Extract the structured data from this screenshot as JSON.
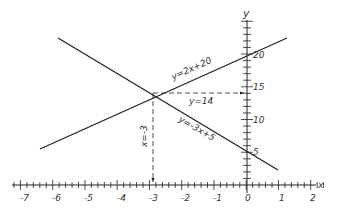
{
  "diagram": {
    "title": "",
    "axes": {
      "x_label": "x",
      "y_label": "y",
      "x_ticks": [
        "-7",
        "-6",
        "-5",
        "-4",
        "-3",
        "-2",
        "-1",
        "0",
        "1",
        "2"
      ],
      "y_ticks": [
        "5",
        "10",
        "15",
        "20"
      ]
    },
    "lines": [
      {
        "equation": "y=2x+20"
      },
      {
        "equation": "y=-3x+5"
      }
    ],
    "annotations": {
      "intersection_y": "y=14",
      "intersection_x": "x=-3"
    },
    "colors": {
      "ink": "#222222",
      "background": "#ffffff"
    }
  },
  "chart_data": {
    "type": "line",
    "title": "",
    "xlabel": "x",
    "ylabel": "y",
    "xlim": [
      -7,
      2
    ],
    "ylim": [
      0,
      22
    ],
    "grid": false,
    "series": [
      {
        "name": "y=2x+20",
        "x": [
          -7.2,
          1.2
        ],
        "y": [
          5.6,
          22.4
        ]
      },
      {
        "name": "y=-3x+5",
        "x": [
          -6,
          0.9
        ],
        "y": [
          23,
          2.3
        ]
      }
    ],
    "annotations": [
      {
        "text": "y=14",
        "type": "dashed-arrow",
        "from": [
          -3,
          14
        ],
        "to": [
          0,
          14
        ]
      },
      {
        "text": "x=-3",
        "type": "dashed-arrow",
        "from": [
          -3,
          14
        ],
        "to": [
          -3,
          0
        ]
      }
    ],
    "intersection": [
      -3,
      14
    ]
  }
}
